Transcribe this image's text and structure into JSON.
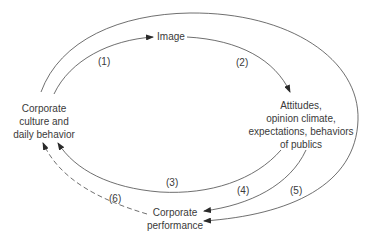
{
  "diagram": {
    "type": "cycle-flow",
    "nodes": {
      "image": {
        "label": "Image"
      },
      "culture": {
        "line1": "Corporate",
        "line2": "culture and",
        "line3": "daily behavior"
      },
      "publics": {
        "line1": "Attitudes,",
        "line2": "opinion climate,",
        "line3": "expectations, behaviors",
        "line4": "of publics"
      },
      "performance": {
        "line1": "Corporate",
        "line2": "performance"
      }
    },
    "edges": [
      {
        "id": "1",
        "label": "(1)",
        "from": "culture",
        "to": "image",
        "style": "solid"
      },
      {
        "id": "2",
        "label": "(2)",
        "from": "image",
        "to": "publics",
        "style": "solid"
      },
      {
        "id": "3",
        "label": "(3)",
        "from": "publics",
        "to": "culture",
        "style": "solid"
      },
      {
        "id": "4",
        "label": "(4)",
        "from": "publics",
        "to": "performance",
        "style": "solid"
      },
      {
        "id": "5",
        "label": "(5)",
        "from": "culture",
        "to": "performance",
        "style": "solid",
        "via": "outer-arc"
      },
      {
        "id": "6",
        "label": "(6)",
        "from": "performance",
        "to": "culture",
        "style": "dashed"
      }
    ],
    "colors": {
      "line": "#4a4a4a",
      "text": "#3a3a3a",
      "background": "#ffffff"
    }
  }
}
